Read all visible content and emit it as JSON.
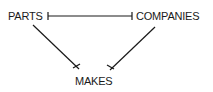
{
  "diagram": {
    "entities": [
      {
        "id": "parts",
        "label": "PARTS"
      },
      {
        "id": "companies",
        "label": "COMPANIES"
      },
      {
        "id": "makes",
        "label": "MAKES"
      }
    ],
    "edges": [
      {
        "from": "parts",
        "to": "companies",
        "from_end": "bar",
        "to_end": "bar"
      },
      {
        "from": "parts",
        "to": "makes",
        "to_end": "crow-x"
      },
      {
        "from": "companies",
        "to": "makes",
        "to_end": "crow-x"
      }
    ],
    "line_color": "#1a1a1a"
  }
}
